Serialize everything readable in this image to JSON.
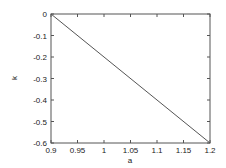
{
  "chart_data": {
    "type": "line",
    "title": "",
    "xlabel": "a",
    "ylabel": "k",
    "xlim": [
      0.9,
      1.2
    ],
    "ylim": [
      -0.6,
      0
    ],
    "xticks": [
      "0.9",
      "0.95",
      "1",
      "1.05",
      "1.1",
      "1.15",
      "1.2"
    ],
    "yticks": [
      "0",
      "-0.1",
      "-0.2",
      "-0.3",
      "-0.4",
      "-0.5",
      "-0.6"
    ],
    "grid": false,
    "legend": null,
    "series": [
      {
        "name": "k(a)",
        "x": [
          0.9,
          1.2
        ],
        "y": [
          0,
          -0.6
        ],
        "color": "#555555"
      }
    ]
  }
}
